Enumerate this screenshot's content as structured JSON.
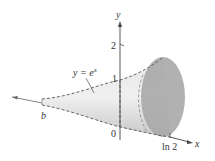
{
  "diagram": {
    "type": "solid-of-revolution",
    "curve_label": "y = e^x",
    "curve_label_parts": {
      "lhs": "y = e",
      "exp": "x"
    },
    "axes": {
      "x_label": "x",
      "y_label": "y"
    },
    "ticks": {
      "y_2": "2",
      "y_1": "1",
      "origin": "0",
      "x_ln2": "ln 2",
      "x_b": "b"
    },
    "colors": {
      "solid_fill": "#d4d4d4",
      "end_cap_fill": "#a9a9a9",
      "axis": "#444444",
      "dash": "#555555"
    }
  }
}
